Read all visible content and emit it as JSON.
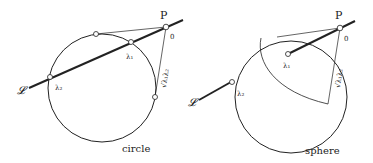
{
  "left": {
    "caption": "circle",
    "P_label": "P",
    "zero_label": "0",
    "lambda1": "λ₁",
    "lambda2": "λ₂",
    "line_label": "𝓛",
    "sqrt_label": "√λ₁λ₂"
  },
  "right": {
    "caption": "sphere",
    "P_label": "P",
    "zero_label": "0",
    "lambda1": "λ₁",
    "lambda2": "λ₂",
    "line_label": "𝓛",
    "sqrt_label": "√λ₁λ₂"
  },
  "colors": {
    "stroke": "#222222",
    "background": "#ffffff"
  }
}
